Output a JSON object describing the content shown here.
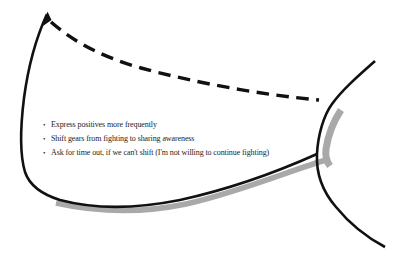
{
  "figure": {
    "colors": {
      "curve": "#111111",
      "shadow": "#a9a9a9",
      "text": "#1c1c1c",
      "background": "#ffffff"
    },
    "notes": {
      "marker": "•",
      "items": [
        {
          "text": "Express positives more frequently"
        },
        {
          "text": "Shift gears from fighting to sharing awareness"
        },
        {
          "text": "Ask for time out, if we can't shift (I'm not willing to continue fighting)"
        }
      ]
    }
  }
}
